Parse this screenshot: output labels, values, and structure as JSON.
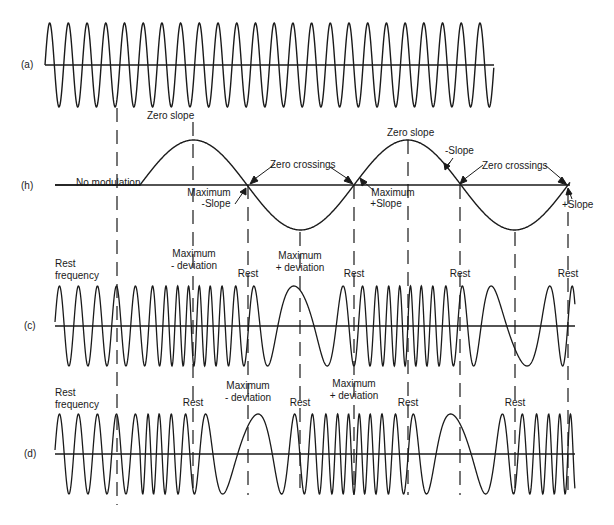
{
  "figure": {
    "panels": {
      "a": {
        "label": "(a)",
        "description": "Unmodulated carrier"
      },
      "h": {
        "label": "(h)",
        "description": "Modulating signal"
      },
      "c": {
        "label": "(c)",
        "description": "FM wave"
      },
      "d": {
        "label": "(d)",
        "description": "PM wave"
      }
    },
    "annotations": {
      "zero_slope_1": "Zero slope",
      "zero_slope_2": "Zero slope",
      "no_modulation": "No modulation",
      "zero_crossings_1": "Zero crossings",
      "zero_crossings_2": "Zero crossings",
      "max_neg_slope": "Maximum\n-Slope",
      "max_neg_slope_l1": "Maximum",
      "max_neg_slope_l2": "-Slope",
      "max_pos_slope_l1": "Maximum",
      "max_pos_slope_l2": "+Slope",
      "neg_slope": "-Slope",
      "pos_slope": "+Slope",
      "c_rest_freq_l1": "Rest",
      "c_rest_freq_l2": "frequency",
      "c_max_neg_dev_l1": "Maximum",
      "c_max_neg_dev_l2": "- deviation",
      "c_max_pos_dev_l1": "Maximum",
      "c_max_pos_dev_l2": "+ deviation",
      "c_rest": [
        "Rest",
        "Rest",
        "Rest",
        "Rest"
      ],
      "d_rest_freq_l1": "Rest",
      "d_rest_freq_l2": "frequency",
      "d_max_neg_dev_l1": "Maximum",
      "d_max_neg_dev_l2": "- deviation",
      "d_max_pos_dev_l1": "Maximum",
      "d_max_pos_dev_l2": "+ deviation",
      "d_rest": [
        "Rest",
        "Rest",
        "Rest",
        "Rest"
      ]
    },
    "colors": {
      "ink": "#1a1a1a",
      "background": "#ffffff"
    }
  }
}
